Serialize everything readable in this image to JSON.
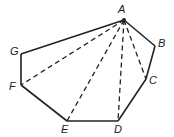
{
  "diagram": {
    "vertices": [
      {
        "label": "A",
        "x": 124,
        "y": 20,
        "lx": 118,
        "ly": 4
      },
      {
        "label": "B",
        "x": 155,
        "y": 46,
        "lx": 158,
        "ly": 38
      },
      {
        "label": "C",
        "x": 146,
        "y": 79,
        "lx": 149,
        "ly": 75
      },
      {
        "label": "D",
        "x": 118,
        "y": 121,
        "lx": 114,
        "ly": 124
      },
      {
        "label": "E",
        "x": 67,
        "y": 121,
        "lx": 61,
        "ly": 124
      },
      {
        "label": "F",
        "x": 21,
        "y": 85,
        "lx": 9,
        "ly": 81
      },
      {
        "label": "G",
        "x": 21,
        "y": 54,
        "lx": 10,
        "ly": 46
      }
    ],
    "solid_edges": [
      "AB",
      "BC",
      "CD",
      "DE",
      "EF",
      "FG",
      "GA"
    ],
    "dashed_diagonals": [
      "AC",
      "AD",
      "AE",
      "AF"
    ]
  }
}
